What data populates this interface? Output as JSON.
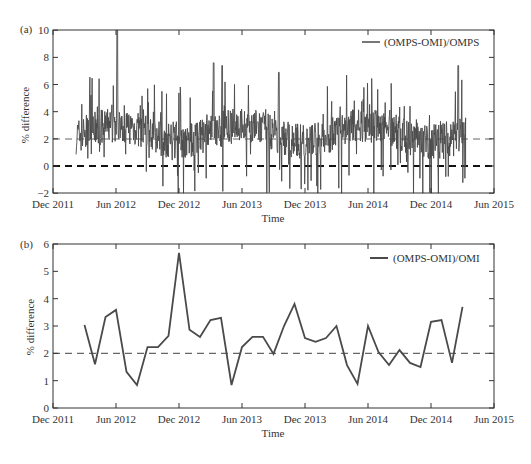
{
  "chart_data": [
    {
      "panel": "(a)",
      "type": "line",
      "title": "",
      "xlabel": "Time",
      "ylabel": "% difference",
      "ylim": [
        -2,
        10
      ],
      "yticks": [
        -2,
        0,
        2,
        4,
        6,
        8,
        10
      ],
      "xtick_labels": [
        "Dec 2011",
        "Jun 2012",
        "Dec 2012",
        "Jun 2013",
        "Dec 2013",
        "Jun 2014",
        "Dec 2014",
        "Jun 2015"
      ],
      "legend": {
        "position": "upper right",
        "entries": [
          "(OMPS-OMI)/OMPS"
        ]
      },
      "reference_lines": [
        {
          "y": 0,
          "style": "dashed",
          "color": "#111111"
        },
        {
          "y": 2,
          "style": "dashed",
          "color": "#666666"
        }
      ],
      "grid": false,
      "series": [
        {
          "name": "(OMPS-OMI)/OMPS",
          "description": "Daily values, Feb 2012 to Mar 2015, noisy around ~2.5%, range approx -2 to 10 (spike ~10 near Jun 2012)",
          "start": "Feb 2012",
          "end": "Mar 2015",
          "approx_mean": 2.4,
          "max": 10.0,
          "min": -2.0,
          "notable_peaks": [
            {
              "x": "Jun 2012",
              "y": 10.0
            },
            {
              "x": "Mar 2013",
              "y": 7.6
            },
            {
              "x": "Apr 2013",
              "y": 7.4
            },
            {
              "x": "Sep 2013",
              "y": 6.9
            },
            {
              "x": "Feb 2015",
              "y": 7.4
            }
          ]
        }
      ]
    },
    {
      "panel": "(b)",
      "type": "line",
      "title": "",
      "xlabel": "Time",
      "ylabel": "% difference",
      "ylim": [
        0,
        6
      ],
      "yticks": [
        0,
        1,
        2,
        3,
        4,
        5,
        6
      ],
      "xtick_labels": [
        "Dec 2011",
        "Jun 2012",
        "Dec 2012",
        "Jun 2013",
        "Dec 2013",
        "Jun 2014",
        "Dec 2014",
        "Jun 2015"
      ],
      "legend": {
        "position": "upper right",
        "entries": [
          "(OMPS-OMI)/OMI"
        ]
      },
      "reference_lines": [
        {
          "y": 2,
          "style": "dashed",
          "color": "#666666"
        }
      ],
      "grid": false,
      "x": [
        "Mar 2012",
        "Apr 2012",
        "May 2012",
        "Jun 2012",
        "Jul 2012",
        "Aug 2012",
        "Sep 2012",
        "Oct 2012",
        "Nov 2012",
        "Dec 2012",
        "Jan 2013",
        "Feb 2013",
        "Mar 2013",
        "Apr 2013",
        "May 2013",
        "Jun 2013",
        "Jul 2013",
        "Aug 2013",
        "Sep 2013",
        "Oct 2013",
        "Nov 2013",
        "Dec 2013",
        "Jan 2014",
        "Feb 2014",
        "Mar 2014",
        "Apr 2014",
        "May 2014",
        "Jun 2014",
        "Jul 2014",
        "Aug 2014",
        "Sep 2014",
        "Oct 2014",
        "Nov 2014",
        "Dec 2014",
        "Jan 2015",
        "Feb 2015",
        "Mar 2015"
      ],
      "series": [
        {
          "name": "(OMPS-OMI)/OMI",
          "values": [
            3.04,
            1.6,
            3.33,
            3.59,
            1.32,
            0.84,
            2.23,
            2.23,
            2.64,
            5.68,
            2.86,
            2.6,
            3.22,
            3.3,
            0.84,
            2.23,
            2.6,
            2.6,
            1.98,
            3.0,
            3.81,
            2.56,
            2.42,
            2.56,
            3.0,
            1.57,
            0.88,
            3.0,
            2.05,
            1.57,
            2.12,
            1.65,
            1.5,
            3.15,
            3.22,
            1.65,
            3.7
          ]
        }
      ]
    }
  ],
  "labels": {
    "panel_a": "(a)",
    "panel_b": "(b)",
    "xlabel": "Time",
    "ylabel": "% difference",
    "legend_a": "(OMPS-OMI)/OMPS",
    "legend_b": "(OMPS-OMI)/OMI",
    "xticks": [
      "Dec 2011",
      "Jun 2012",
      "Dec 2012",
      "Jun 2013",
      "Dec 2013",
      "Jun 2014",
      "Dec 2014",
      "Jun 2015"
    ],
    "yticks_a": [
      "-2",
      "0",
      "2",
      "4",
      "6",
      "8",
      "10"
    ],
    "yticks_b": [
      "0",
      "1",
      "2",
      "3",
      "4",
      "5",
      "6"
    ]
  },
  "colors": {
    "series": "#4a4a4a",
    "axis": "#333333",
    "zero_line": "#111111",
    "ref_line": "#666666"
  }
}
